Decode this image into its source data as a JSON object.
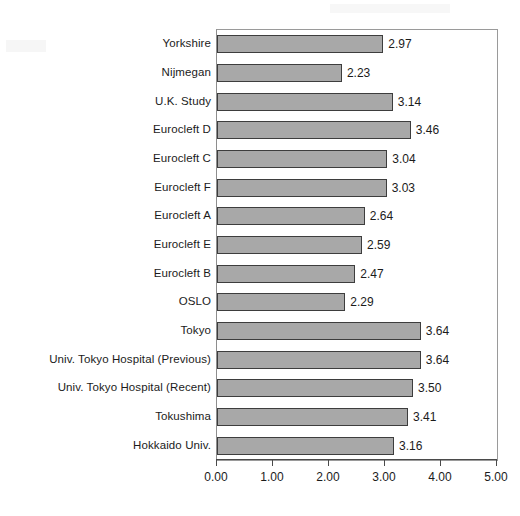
{
  "chart_data": {
    "type": "bar",
    "orientation": "horizontal",
    "title": "",
    "subtitle": "",
    "xlabel": "",
    "ylabel": "",
    "xlim": [
      0.0,
      5.0
    ],
    "xtick_labels": [
      "0.00",
      "1.00",
      "2.00",
      "3.00",
      "4.00",
      "5.00"
    ],
    "xticks": [
      0.0,
      1.0,
      2.0,
      3.0,
      4.0,
      5.0
    ],
    "grid": false,
    "legend": false,
    "legend_position": "none",
    "data_labels": true,
    "bar_fill_color": "#a8a8a8",
    "bar_border_color": "#3d3d3d",
    "plot_border_color": "#9a9a9a",
    "axis_color": "#4a4a4a",
    "text_color": "#1b1b1b",
    "categories": [
      "Yorkshire",
      "Nijmegan",
      "U.K. Study",
      "Eurocleft D",
      "Eurocleft C",
      "Eurocleft F",
      "Eurocleft A",
      "Eurocleft E",
      "Eurocleft B",
      "OSLO",
      "Tokyo",
      "Univ. Tokyo Hospital (Previous)",
      "Univ. Tokyo Hospital (Recent)",
      "Tokushima",
      "Hokkaido Univ."
    ],
    "values": [
      2.97,
      2.23,
      3.14,
      3.46,
      3.04,
      3.03,
      2.64,
      2.59,
      2.47,
      2.29,
      3.64,
      3.64,
      3.5,
      3.41,
      3.16
    ],
    "value_labels": [
      "2.97",
      "2.23",
      "3.14",
      "3.46",
      "3.04",
      "3.03",
      "2.64",
      "2.59",
      "2.47",
      "2.29",
      "3.64",
      "3.64",
      "3.50",
      "3.41",
      "3.16"
    ]
  }
}
